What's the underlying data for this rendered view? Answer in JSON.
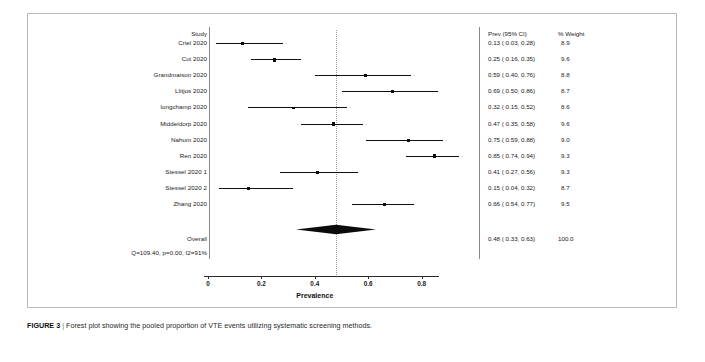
{
  "figure": {
    "caption_label": "FIGURE 3",
    "caption_separator": "|",
    "caption_text": "Forest plot showing the pooled proportion of VTE events utilizing systematic screening methods."
  },
  "columns": {
    "study_header": "Study",
    "effect_header": "Prev (95% CI)",
    "weight_header": "% Weight"
  },
  "heterogeneity": "Q=109.40, p=0.00, I2=91%",
  "overall_label": "Overall",
  "chart_data": {
    "type": "forest",
    "title": "",
    "xlabel": "Prevalence",
    "ylabel": "",
    "xlim": [
      -0.04,
      0.95
    ],
    "xticks": [
      0,
      0.2,
      0.4,
      0.6,
      0.8
    ],
    "xticklabels": [
      "0",
      "0.2",
      "0.4",
      "0.6",
      "0.8"
    ],
    "grid": false,
    "reference_line": 0.48,
    "effect_measure": "Prevalence",
    "studies": [
      {
        "label": "Criel 2020",
        "estimate": 0.13,
        "ci_low": 0.03,
        "ci_high": 0.28,
        "weight": 8.9,
        "effect_text": "0.13 ( 0.03, 0.28)",
        "weight_text": "8.9"
      },
      {
        "label": "Cui 2020",
        "estimate": 0.25,
        "ci_low": 0.16,
        "ci_high": 0.35,
        "weight": 9.6,
        "effect_text": "0.25 ( 0.16, 0.35)",
        "weight_text": "9.6"
      },
      {
        "label": "Grandmaison 2020",
        "estimate": 0.59,
        "ci_low": 0.4,
        "ci_high": 0.76,
        "weight": 8.8,
        "effect_text": "0.59 ( 0.40, 0.76)",
        "weight_text": "8.8"
      },
      {
        "label": "Llitjos 2020",
        "estimate": 0.69,
        "ci_low": 0.5,
        "ci_high": 0.86,
        "weight": 8.7,
        "effect_text": "0.69 ( 0.50, 0.86)",
        "weight_text": "8.7"
      },
      {
        "label": "longchamp 2020",
        "estimate": 0.32,
        "ci_low": 0.15,
        "ci_high": 0.52,
        "weight": 8.6,
        "effect_text": "0.32 ( 0.15, 0.52)",
        "weight_text": "8.6"
      },
      {
        "label": "Middeldorp 2020",
        "estimate": 0.47,
        "ci_low": 0.35,
        "ci_high": 0.58,
        "weight": 9.6,
        "effect_text": "0.47 ( 0.35, 0.58)",
        "weight_text": "9.6"
      },
      {
        "label": "Nahum 2020",
        "estimate": 0.75,
        "ci_low": 0.59,
        "ci_high": 0.88,
        "weight": 9.0,
        "effect_text": "0.75 ( 0.59, 0.88)",
        "weight_text": "9.0"
      },
      {
        "label": "Ren 2020",
        "estimate": 0.85,
        "ci_low": 0.74,
        "ci_high": 0.94,
        "weight": 9.3,
        "effect_text": "0.85 ( 0.74, 0.94)",
        "weight_text": "9.3"
      },
      {
        "label": "Stessel 2020 1",
        "estimate": 0.41,
        "ci_low": 0.27,
        "ci_high": 0.56,
        "weight": 9.3,
        "effect_text": "0.41 ( 0.27, 0.56)",
        "weight_text": "9.3"
      },
      {
        "label": "Stessel 2020 2",
        "estimate": 0.15,
        "ci_low": 0.04,
        "ci_high": 0.32,
        "weight": 8.7,
        "effect_text": "0.15 ( 0.04, 0.32)",
        "weight_text": "8.7"
      },
      {
        "label": "Zhang 2020",
        "estimate": 0.66,
        "ci_low": 0.54,
        "ci_high": 0.77,
        "weight": 9.5,
        "effect_text": "0.66 ( 0.54, 0.77)",
        "weight_text": "9.5"
      }
    ],
    "overall": {
      "label": "Overall",
      "estimate": 0.48,
      "ci_low": 0.33,
      "ci_high": 0.63,
      "weight": 100.0,
      "effect_text": "0.48 ( 0.33, 0.63)",
      "weight_text": "100.0"
    }
  }
}
